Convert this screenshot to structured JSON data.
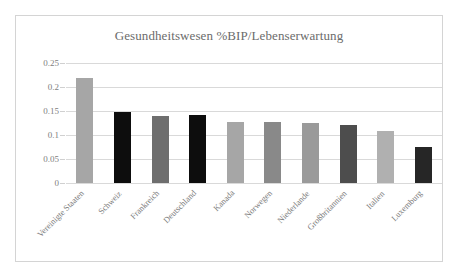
{
  "chart_data": {
    "type": "bar",
    "title": "Gesundheitswesen %BIP/Lebenserwartung",
    "xlabel": "",
    "ylabel": "",
    "ylim": [
      0,
      0.25
    ],
    "ytick_labels": [
      "0.25",
      "0.2",
      "0.15",
      "0.1",
      "0.05",
      "0"
    ],
    "ytick_values": [
      0.25,
      0.2,
      0.15,
      0.1,
      0.05,
      0
    ],
    "grid": true,
    "legend": "none",
    "categories": [
      "Vereinigte Staaten",
      "Schweiz",
      "Frankreich",
      "Deutschland",
      "Kanada",
      "Norwegen",
      "Niederlande",
      "Großbritannien",
      "Italien",
      "Luxemburg"
    ],
    "values": [
      0.219,
      0.148,
      0.14,
      0.141,
      0.128,
      0.127,
      0.126,
      0.12,
      0.108,
      0.075
    ],
    "bar_colors": [
      "#a6a6a6",
      "#0d0d0d",
      "#6e6e6e",
      "#0d0d0d",
      "#a6a6a6",
      "#898989",
      "#9a9a9a",
      "#4d4d4d",
      "#b0b0b0",
      "#262626"
    ]
  },
  "colors": {
    "frame_border": "#d4d4d4",
    "gridline": "#d9d9d9",
    "text": "#7a7a7a",
    "title": "#6b6b6b",
    "background": "#ffffff"
  }
}
